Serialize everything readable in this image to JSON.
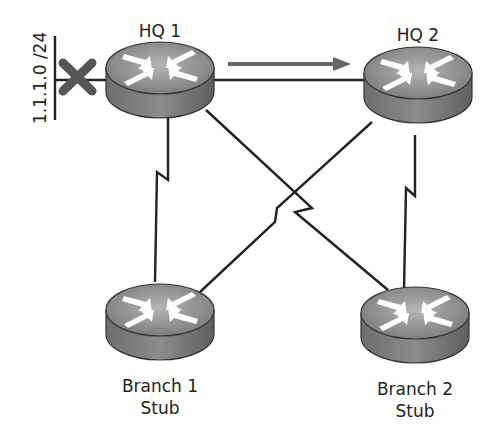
{
  "diagram": {
    "type": "network-topology",
    "nodes": [
      {
        "id": "hq1",
        "label": "HQ 1",
        "kind": "router"
      },
      {
        "id": "hq2",
        "label": "HQ 2",
        "kind": "router"
      },
      {
        "id": "branch1",
        "label_line1": "Branch 1",
        "label_line2": "Stub",
        "kind": "router"
      },
      {
        "id": "branch2",
        "label_line1": "Branch 2",
        "label_line2": "Stub",
        "kind": "router"
      }
    ],
    "links": [
      {
        "from": "hq1",
        "to": "hq2",
        "style": "ethernet"
      },
      {
        "from": "hq1",
        "to": "branch1",
        "style": "serial"
      },
      {
        "from": "hq1",
        "to": "branch2",
        "style": "serial"
      },
      {
        "from": "hq2",
        "to": "branch1",
        "style": "serial"
      },
      {
        "from": "hq2",
        "to": "branch2",
        "style": "serial"
      }
    ],
    "network": {
      "label": "1.1.1.0 /24",
      "status": "down",
      "marker": "x-icon"
    },
    "arrow": {
      "from": "hq1",
      "to": "hq2",
      "meaning": "direction"
    },
    "colors": {
      "router": "#8a8a8a",
      "link": "#222222",
      "x_marker": "#555555",
      "arrow": "#666666"
    }
  }
}
